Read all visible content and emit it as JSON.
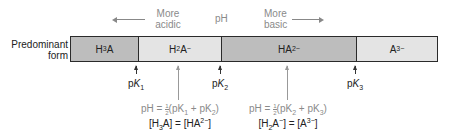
{
  "header": {
    "left_label_line1": "More",
    "left_label_line2": "acidic",
    "center_label": "pH",
    "right_label_line1": "More",
    "right_label_line2": "basic"
  },
  "row_label": {
    "line1": "Predominant",
    "line2": "form"
  },
  "segments": [
    {
      "base": "H",
      "sub": "3",
      "rest": "A",
      "sup": "",
      "color": "#bdbdbd",
      "width": 67
    },
    {
      "base": "H",
      "sub": "2",
      "rest": "A",
      "sup": "−",
      "color": "#e4e4e4",
      "width": 83
    },
    {
      "base": "HA",
      "sub": "",
      "rest": "",
      "sup": "2−",
      "color": "#bdbdbd",
      "width": 135
    },
    {
      "base": "A",
      "sub": "",
      "rest": "",
      "sup": "3−",
      "color": "#e4e4e4",
      "width": 83
    }
  ],
  "pk_markers": [
    {
      "prefix": "p",
      "k": "K",
      "sub": "1"
    },
    {
      "prefix": "p",
      "k": "K",
      "sub": "2"
    },
    {
      "prefix": "p",
      "k": "K",
      "sub": "3"
    }
  ],
  "midpoints": [
    {
      "formula_prefix": "pH = ",
      "fraction_num": "1",
      "fraction_den": "2",
      "formula_rest_a": "(pK",
      "sub_a": "1",
      "formula_rest_b": " + pK",
      "sub_b": "2",
      "formula_close": ")",
      "eq_left_base": "[H",
      "eq_left_sub": "3",
      "eq_left_rest": "A]",
      "eq_left_sup": "",
      "eq_mid": " = ",
      "eq_right_base": "[HA",
      "eq_right_sup": "2−",
      "eq_right_close": "]"
    },
    {
      "formula_prefix": "pH = ",
      "fraction_num": "1",
      "fraction_den": "2",
      "formula_rest_a": "(pK",
      "sub_a": "2",
      "formula_rest_b": " + pK",
      "sub_b": "3",
      "formula_close": ")",
      "eq_left_base": "[H",
      "eq_left_sub": "2",
      "eq_left_rest": "A",
      "eq_left_sup": "−",
      "eq_mid": "] = ",
      "eq_right_base": "[A",
      "eq_right_sup": "3−",
      "eq_right_close": "]"
    }
  ],
  "colors": {
    "dark_segment": "#bdbdbd",
    "light_segment": "#e4e4e4",
    "gray_text": "#8a8a8a"
  }
}
